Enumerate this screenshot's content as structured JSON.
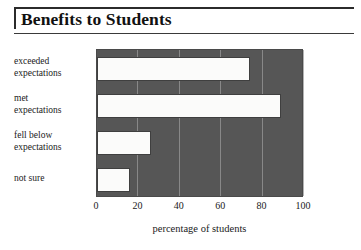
{
  "title": "Benefits to Students",
  "chart_data": {
    "type": "bar",
    "orientation": "horizontal",
    "title": "Benefits to Students",
    "xlabel": "percentage of students",
    "ylabel": "",
    "xlim": [
      0,
      100
    ],
    "xticks": [
      "0",
      "20",
      "40",
      "60",
      "80",
      "100"
    ],
    "xtick_values": [
      0,
      20,
      40,
      60,
      80,
      100
    ],
    "grid": true,
    "legend": "none",
    "plot_background": "#565656",
    "bar_color": "#fbfbfa",
    "bar_edge_color": "#3f3f3f",
    "gridline_color": "#9a9a9a",
    "categories": [
      "exceeded expectations",
      "met expectations",
      "fell below expectations",
      "not sure"
    ],
    "category_lines": [
      [
        "exceeded",
        "expectations"
      ],
      [
        "met",
        "expectations"
      ],
      [
        "fell below",
        "expectations"
      ],
      [
        "not sure",
        ""
      ]
    ],
    "values": [
      74,
      89,
      26,
      16
    ]
  }
}
